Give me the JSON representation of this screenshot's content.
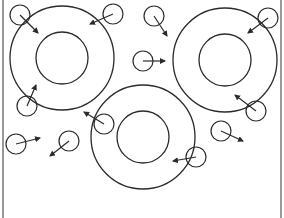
{
  "diagram": {
    "width": 284,
    "height": 218,
    "stroke_color": "#2b2b2b",
    "background": "#ffffff",
    "frame": {
      "left_x": 3,
      "right_x": 281
    },
    "rings": [
      {
        "id": "ring-top-left",
        "cx": 62,
        "cy": 58,
        "outer_r": 52,
        "inner_r": 26
      },
      {
        "id": "ring-top-right",
        "cx": 225,
        "cy": 60,
        "outer_r": 52,
        "inner_r": 26
      },
      {
        "id": "ring-bottom-center",
        "cx": 143,
        "cy": 137,
        "outer_r": 52,
        "inner_r": 26
      }
    ],
    "particles": [
      {
        "cx": 20,
        "cy": 15,
        "r": 10,
        "to": [
          38,
          33
        ]
      },
      {
        "cx": 113,
        "cy": 14,
        "r": 10,
        "to": [
          90,
          24
        ]
      },
      {
        "cx": 154,
        "cy": 16,
        "r": 10,
        "to": [
          167,
          36
        ]
      },
      {
        "cx": 268,
        "cy": 18,
        "r": 10,
        "to": [
          248,
          33
        ]
      },
      {
        "cx": 143,
        "cy": 61,
        "r": 10,
        "to": [
          165,
          61
        ]
      },
      {
        "cx": 27,
        "cy": 106,
        "r": 10,
        "to": [
          36,
          85
        ]
      },
      {
        "cx": 256,
        "cy": 111,
        "r": 10,
        "to": [
          235,
          95
        ]
      },
      {
        "cx": 16,
        "cy": 144,
        "r": 10,
        "to": [
          40,
          138
        ]
      },
      {
        "cx": 69,
        "cy": 141,
        "r": 10,
        "to": [
          50,
          156
        ]
      },
      {
        "cx": 104,
        "cy": 124,
        "r": 10,
        "to": [
          84,
          112
        ]
      },
      {
        "cx": 221,
        "cy": 131,
        "r": 10,
        "to": [
          243,
          141
        ]
      },
      {
        "cx": 196,
        "cy": 157,
        "r": 10,
        "to": [
          173,
          161
        ]
      }
    ]
  }
}
